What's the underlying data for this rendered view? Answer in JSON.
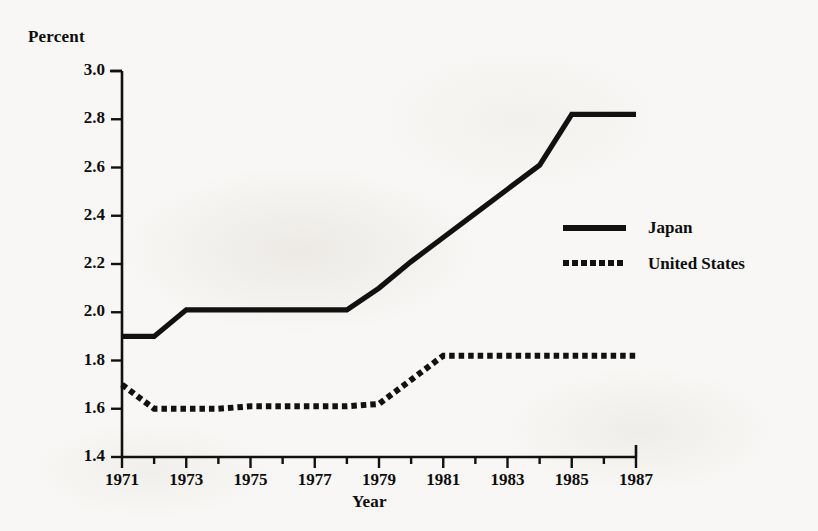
{
  "chart_data": {
    "type": "line",
    "title": "",
    "xlabel": "Year",
    "ylabel": "Percent",
    "xlim": [
      1971,
      1987
    ],
    "ylim": [
      1.4,
      3.0
    ],
    "ytick_step": 0.2,
    "xtick_step": 2,
    "xtick_minor_step": 1,
    "grid": false,
    "legend_position": "center-right",
    "yticks": [
      "3.0",
      "2.8",
      "2.6",
      "2.4",
      "2.2",
      "2.0",
      "1.8",
      "1.6",
      "1.4"
    ],
    "ytick_values": [
      3.0,
      2.8,
      2.6,
      2.4,
      2.2,
      2.0,
      1.8,
      1.6,
      1.4
    ],
    "xticks": [
      "1971",
      "1973",
      "1975",
      "1977",
      "1979",
      "1981",
      "1983",
      "1985",
      "1987"
    ],
    "xtick_values": [
      1971,
      1973,
      1975,
      1977,
      1979,
      1981,
      1983,
      1985,
      1987
    ],
    "x": [
      1971,
      1972,
      1973,
      1974,
      1975,
      1976,
      1977,
      1978,
      1979,
      1980,
      1981,
      1982,
      1983,
      1984,
      1985,
      1986,
      1987
    ],
    "series": [
      {
        "name": "Japan",
        "style": "solid",
        "color": "#111111",
        "values": [
          1.9,
          1.9,
          2.01,
          2.01,
          2.01,
          2.01,
          2.01,
          2.01,
          2.1,
          2.21,
          2.31,
          2.41,
          2.51,
          2.61,
          2.82,
          2.82,
          2.82
        ]
      },
      {
        "name": "United States",
        "style": "dotted",
        "color": "#111111",
        "values": [
          1.7,
          1.6,
          1.6,
          1.6,
          1.61,
          1.61,
          1.61,
          1.61,
          1.62,
          1.72,
          1.82,
          1.82,
          1.82,
          1.82,
          1.82,
          1.82,
          1.82
        ]
      }
    ]
  },
  "legend": {
    "items": [
      {
        "label": "Japan",
        "style": "solid"
      },
      {
        "label": "United States",
        "style": "dotted"
      }
    ]
  }
}
